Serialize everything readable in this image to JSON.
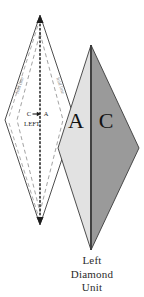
{
  "figure": {
    "caption_lines": [
      "Left",
      "Diamond",
      "Unit"
    ],
    "left_diamond": {
      "edge_label_upper_left": "fold line",
      "edge_label_upper_right": "fold line",
      "center_annotation": {
        "from_label": "C",
        "to_label": "A",
        "arrow": "→",
        "direction_label": "LEFT"
      }
    },
    "right_diamond": {
      "left_half_label": "A",
      "right_half_label": "C"
    },
    "colors": {
      "outline": "#3a3a3a",
      "left_diamond_fill": "#ffffff",
      "region_a_fill": "#e2e2e2",
      "region_c_fill": "#9a9a9a",
      "fold_line": "#8a8a8a",
      "center_line": "#1d1d1d",
      "text": "#1a1a1a",
      "caption_text": "#2b2b2b",
      "background": "#ffffff"
    }
  }
}
